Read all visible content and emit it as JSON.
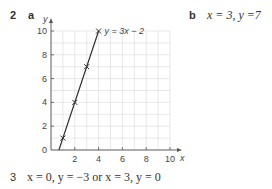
{
  "q2": {
    "number": "2",
    "part_a_label": "a",
    "part_b_label": "b",
    "part_b_answer": "x = 3, y =7"
  },
  "q3": {
    "number": "3",
    "answer": "x = 0, y = −3 or x = 3, y = 0"
  },
  "chart_data": {
    "type": "line",
    "title": "",
    "xlabel": "x",
    "ylabel": "y",
    "xlim": [
      0,
      10
    ],
    "ylim": [
      0,
      10
    ],
    "xticks": [
      2,
      4,
      6,
      8,
      10
    ],
    "yticks": [
      0,
      2,
      4,
      6,
      8,
      10
    ],
    "grid": true,
    "series": [
      {
        "name": "y = 3x − 2",
        "x": [
          1,
          2,
          3,
          4
        ],
        "y": [
          1,
          4,
          7,
          10
        ],
        "marker": "x"
      }
    ],
    "line_label": "y = 3x − 2"
  }
}
